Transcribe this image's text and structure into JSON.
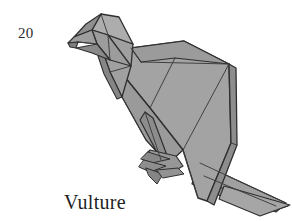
{
  "page": {
    "width": 292,
    "height": 221,
    "background_color": "#ffffff"
  },
  "figure": {
    "number": "20",
    "caption": "Vulture",
    "number_color": "#2b2b2b",
    "caption_color": "#1f1f1f"
  },
  "illustration": {
    "name": "origami-vulture-drawing",
    "style": "line-drawing-with-flat-gray-shading",
    "paper_fill_light": "#b0b0b0",
    "paper_fill_mid": "#9a9a9a",
    "paper_fill_dark": "#8a8a8a",
    "paper_fill_shadow": "#787878",
    "outline_color": "#2f2f2f",
    "crease_color": "#3c3c3c",
    "outline_width": 1.4,
    "crease_width": 1.0,
    "parts": [
      {
        "name": "head",
        "fill": "#a6a6a6"
      },
      {
        "name": "beak",
        "fill": "#8f8f8f"
      },
      {
        "name": "neck",
        "fill": "#9c9c9c"
      },
      {
        "name": "back",
        "fill": "#a8a8a8"
      },
      {
        "name": "wing",
        "fill": "#a2a2a2"
      },
      {
        "name": "breast",
        "fill": "#9a9a9a"
      },
      {
        "name": "leg",
        "fill": "#8c8c8c"
      },
      {
        "name": "foot-talons",
        "fill": "#8a8a8a"
      },
      {
        "name": "tail",
        "fill": "#9e9e9e"
      }
    ]
  }
}
